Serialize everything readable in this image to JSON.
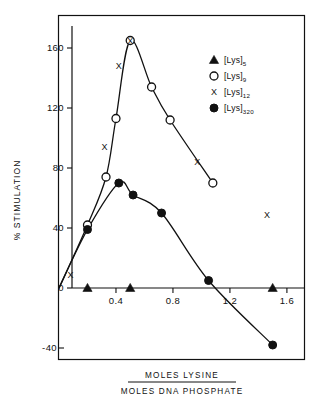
{
  "chart_data": {
    "type": "line",
    "title": "",
    "xlabel_numerator": "MOLES  LYSINE",
    "xlabel_denominator": "MOLES  DNA  PHOSPHATE",
    "ylabel": "% STIMULATION",
    "xlim": [
      0,
      1.72
    ],
    "ylim": [
      -55,
      180
    ],
    "xticks": [
      0.4,
      0.8,
      1.2,
      1.6
    ],
    "xtick_labels": [
      "0.4",
      "0.8",
      "1.2",
      "1.6"
    ],
    "yticks": [
      -40,
      0,
      40,
      80,
      120,
      160
    ],
    "ytick_labels": [
      "-40",
      "0",
      "40",
      "80",
      "120",
      "160"
    ],
    "grid": false,
    "legend_position": "top-right",
    "series": [
      {
        "name": "[Lys]5",
        "label_base": "[Lys]",
        "label_sub": "5",
        "marker": "filled-triangle",
        "points": [
          {
            "x": 0.2,
            "y": 0
          },
          {
            "x": 0.5,
            "y": 0
          },
          {
            "x": 1.5,
            "y": 0
          }
        ],
        "has_curve": false
      },
      {
        "name": "[Lys]9",
        "label_base": "[Lys]",
        "label_sub": "9",
        "marker": "open-circle",
        "points": [
          {
            "x": 0.2,
            "y": 42
          },
          {
            "x": 0.33,
            "y": 74
          },
          {
            "x": 0.4,
            "y": 113
          },
          {
            "x": 0.5,
            "y": 165
          },
          {
            "x": 0.65,
            "y": 134
          },
          {
            "x": 0.78,
            "y": 112
          },
          {
            "x": 1.08,
            "y": 70
          }
        ],
        "has_curve": true
      },
      {
        "name": "[Lys]12",
        "label_base": "[Lys]",
        "label_sub": "12",
        "marker": "x",
        "points": [
          {
            "x": 0.08,
            "y": 9
          },
          {
            "x": 0.32,
            "y": 94
          },
          {
            "x": 0.42,
            "y": 148
          },
          {
            "x": 0.5,
            "y": 165
          },
          {
            "x": 0.97,
            "y": 84
          },
          {
            "x": 1.46,
            "y": 49
          }
        ],
        "has_curve": false
      },
      {
        "name": "[Lys]320",
        "label_base": "[Lys]",
        "label_sub": "320",
        "marker": "filled-circle",
        "points": [
          {
            "x": 0.2,
            "y": 39
          },
          {
            "x": 0.42,
            "y": 70
          },
          {
            "x": 0.52,
            "y": 62
          },
          {
            "x": 0.72,
            "y": 50
          },
          {
            "x": 1.05,
            "y": 5
          },
          {
            "x": 1.5,
            "y": -38
          }
        ],
        "has_curve": true
      }
    ]
  },
  "legend": {
    "items": [
      {
        "marker": "filled-triangle",
        "base": "[Lys]",
        "sub": "5"
      },
      {
        "marker": "open-circle",
        "base": "[Lys]",
        "sub": "9"
      },
      {
        "marker": "x",
        "base": "[Lys]",
        "sub": "12"
      },
      {
        "marker": "filled-circle",
        "base": "[Lys]",
        "sub": "320"
      }
    ]
  },
  "colors": {
    "ink": "#111111",
    "background": "#ffffff"
  }
}
